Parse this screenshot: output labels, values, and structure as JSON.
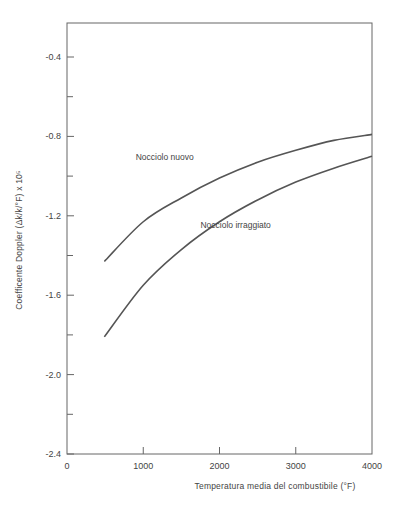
{
  "chart_data": {
    "type": "line",
    "title": "",
    "xlabel": "Temperatura media del combustibile (°F)",
    "ylabel": "Coefficente Doppler (Δk/k/°F) x 10⁵",
    "xlim": [
      0,
      4000
    ],
    "ylim": [
      -2.4,
      -0.2
    ],
    "x_ticks": [
      0,
      1000,
      2000,
      3000,
      4000
    ],
    "x_tick_labels": [
      "0",
      "1000",
      "2000",
      "3000",
      "4000"
    ],
    "y_ticks": [
      -0.4,
      -0.8,
      -1.2,
      -1.6,
      -2.0,
      -2.4
    ],
    "y_tick_labels": [
      "-0.4",
      "-0.8",
      "-1.2",
      "-1.6",
      "-2.0",
      "-2.4"
    ],
    "y_minor_ticks": [
      -0.6,
      -1.0,
      -1.4,
      -1.8,
      -2.2
    ],
    "x_minor_ticks": [
      1000,
      2000,
      3000
    ],
    "grid": false,
    "legend": "inline labels",
    "series": [
      {
        "name": "Nocciolo nuovo",
        "x": [
          490,
          1000,
          1500,
          2000,
          2500,
          3000,
          3500,
          4000
        ],
        "y": [
          -1.43,
          -1.23,
          -1.11,
          -1.01,
          -0.93,
          -0.87,
          -0.82,
          -0.79
        ],
        "label_position": {
          "x": 900,
          "y": -0.92
        }
      },
      {
        "name": "Nocciolo irraggiato",
        "x": [
          490,
          1000,
          1500,
          2000,
          2500,
          3000,
          3500,
          4000
        ],
        "y": [
          -1.81,
          -1.55,
          -1.37,
          -1.23,
          -1.12,
          -1.03,
          -0.96,
          -0.9
        ],
        "label_position": {
          "x": 1750,
          "y": -1.26
        }
      }
    ]
  },
  "colors": {
    "line": "#555555",
    "axis": "#555555",
    "text": "#444444"
  }
}
